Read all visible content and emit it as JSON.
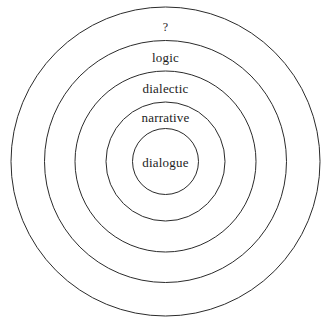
{
  "diagram": {
    "type": "concentric-circles",
    "title": "",
    "background_color": "#ffffff",
    "stroke_color": "#2b2b2b",
    "text_color": "#1c1c1c",
    "center": {
      "x": 165.5,
      "y": 161.5
    },
    "rings": [
      {
        "index": 0,
        "label": "?",
        "radius": 154.5,
        "label_x": 165.5,
        "label_y": 27,
        "level": "outermost"
      },
      {
        "index": 1,
        "label": "logic",
        "radius": 121,
        "label_x": 165.5,
        "label_y": 57,
        "level": "second"
      },
      {
        "index": 2,
        "label": "dialectic",
        "radius": 90.5,
        "label_x": 165.5,
        "label_y": 88,
        "level": "third"
      },
      {
        "index": 3,
        "label": "narrative",
        "radius": 59.5,
        "label_x": 165.5,
        "label_y": 117,
        "level": "fourth"
      },
      {
        "index": 4,
        "label": "dialogue",
        "radius": 33,
        "label_x": 165.5,
        "label_y": 162,
        "level": "innermost"
      }
    ]
  }
}
